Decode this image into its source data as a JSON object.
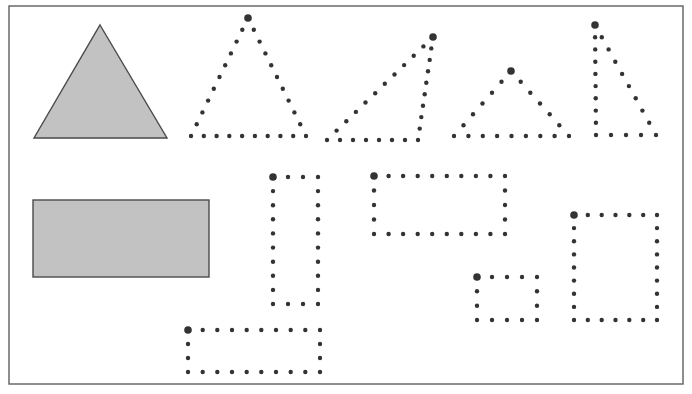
{
  "worksheet": {
    "frame": {
      "x": 9,
      "y": 6,
      "width": 674,
      "height": 378
    },
    "colors": {
      "fill": "#c2c2c2",
      "stroke": "#4a4a4a",
      "dot": "#333333",
      "frame": "#6a6a6a"
    },
    "dot_radius": 2.2,
    "start_dot_radius": 3.8,
    "solid_shapes": [
      {
        "name": "reference-triangle",
        "type": "polygon",
        "points": [
          [
            100,
            25
          ],
          [
            167,
            138
          ],
          [
            34,
            138
          ]
        ]
      },
      {
        "name": "reference-rectangle",
        "type": "rect",
        "x": 33,
        "y": 200,
        "width": 176,
        "height": 77
      }
    ],
    "dotted_shapes": [
      {
        "name": "dotted-triangle-isosceles-1",
        "type": "triangle",
        "start": [
          248,
          18
        ],
        "edges": [
          {
            "from": [
              248,
              18
            ],
            "to": [
              306,
              136
            ],
            "count": 10
          },
          {
            "from": [
              306,
              136
            ],
            "to": [
              191,
              136
            ],
            "count": 9
          },
          {
            "from": [
              191,
              136
            ],
            "to": [
              248,
              18
            ],
            "count": 10
          }
        ]
      },
      {
        "name": "dotted-triangle-obtuse",
        "type": "triangle",
        "start": [
          433,
          37
        ],
        "edges": [
          {
            "from": [
              433,
              37
            ],
            "to": [
              418,
              140
            ],
            "count": 9
          },
          {
            "from": [
              418,
              140
            ],
            "to": [
              327,
              140
            ],
            "count": 7
          },
          {
            "from": [
              327,
              140
            ],
            "to": [
              433,
              37
            ],
            "count": 11
          }
        ]
      },
      {
        "name": "dotted-triangle-isosceles-2",
        "type": "triangle",
        "start": [
          511,
          71
        ],
        "edges": [
          {
            "from": [
              511,
              71
            ],
            "to": [
              569,
              136
            ],
            "count": 6
          },
          {
            "from": [
              569,
              136
            ],
            "to": [
              454,
              136
            ],
            "count": 8
          },
          {
            "from": [
              454,
              136
            ],
            "to": [
              511,
              71
            ],
            "count": 6
          }
        ]
      },
      {
        "name": "dotted-triangle-right",
        "type": "triangle",
        "start": [
          595,
          25
        ],
        "edges": [
          {
            "from": [
              595,
              25
            ],
            "to": [
              656,
              135
            ],
            "count": 9
          },
          {
            "from": [
              656,
              135
            ],
            "to": [
              596,
              135
            ],
            "count": 4
          },
          {
            "from": [
              596,
              135
            ],
            "to": [
              595,
              25
            ],
            "count": 9
          }
        ]
      },
      {
        "name": "dotted-rectangle-tall",
        "type": "rect",
        "start": [
          273,
          177
        ],
        "x": 273,
        "y": 177,
        "x2": 318,
        "y2": 304,
        "cols": 4,
        "rows": 10
      },
      {
        "name": "dotted-rectangle-wide-bottom",
        "type": "rect",
        "start": [
          188,
          330
        ],
        "x": 188,
        "y": 330,
        "x2": 320,
        "y2": 372,
        "cols": 10,
        "rows": 4
      },
      {
        "name": "dotted-rectangle-wide-top",
        "type": "rect",
        "start": [
          374,
          176
        ],
        "x": 374,
        "y": 176,
        "x2": 505,
        "y2": 234,
        "cols": 10,
        "rows": 5
      },
      {
        "name": "dotted-rectangle-small",
        "type": "rect",
        "start": [
          477,
          277
        ],
        "x": 477,
        "y": 277,
        "x2": 537,
        "y2": 320,
        "cols": 5,
        "rows": 4
      },
      {
        "name": "dotted-rectangle-square",
        "type": "rect",
        "start": [
          574,
          215
        ],
        "x": 574,
        "y": 215,
        "x2": 657,
        "y2": 320,
        "cols": 7,
        "rows": 9
      }
    ]
  }
}
